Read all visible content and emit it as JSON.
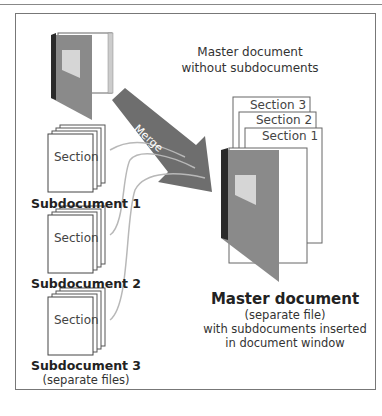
{
  "diagram": {
    "top_caption": {
      "line1": "Master document",
      "line2": "without subdocuments"
    },
    "merge_arrow": {
      "label": "Merge"
    },
    "subdocuments": [
      {
        "section_label": "Section",
        "name": "Subdocument 1"
      },
      {
        "section_label": "Section",
        "name": "Subdocument 2"
      },
      {
        "section_label": "Section",
        "name": "Subdocument 3"
      }
    ],
    "subdocuments_note": "(separate files)",
    "master_sections": [
      "Section 3",
      "Section 2",
      "Section 1"
    ],
    "master_caption": {
      "title": "Master document",
      "line1": "(separate file)",
      "line2": "with subdocuments inserted",
      "line3": "in document window"
    },
    "colors": {
      "book_cover": "#8a8a8a",
      "book_spine": "#2a2a2a",
      "book_label": "#d6d6d6",
      "merge_arrow": "#6e6e6e",
      "connector_lines": "#b8b8b8",
      "frame_border": "#777777"
    }
  }
}
